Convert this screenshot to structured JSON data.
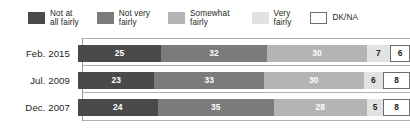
{
  "legend": {
    "items": [
      {
        "label": "Not at\nall fairly",
        "color": "#4a4a4a",
        "outlined": false
      },
      {
        "label": "Not very\nfairly",
        "color": "#7b7b7b",
        "outlined": false
      },
      {
        "label": "Somewhat\nfairly",
        "color": "#b4b4b4",
        "outlined": false
      },
      {
        "label": "Very\nfairly",
        "color": "#e2e2e2",
        "outlined": false
      },
      {
        "label": "DK/NA",
        "color": "#ffffff",
        "outlined": true
      }
    ]
  },
  "chart_data": {
    "type": "bar",
    "orientation": "horizontal",
    "stacked": true,
    "stack_total": 100,
    "title": "",
    "xlabel": "",
    "ylabel": "",
    "xlim": [
      0,
      100
    ],
    "grid": true,
    "legend_position": "top",
    "categories": [
      "Feb. 2015",
      "Jul. 2009",
      "Dec. 2007"
    ],
    "series": [
      {
        "name": "Not at all fairly",
        "color": "#4a4a4a",
        "values": [
          25,
          23,
          24
        ]
      },
      {
        "name": "Not very fairly",
        "color": "#7b7b7b",
        "values": [
          32,
          33,
          35
        ]
      },
      {
        "name": "Somewhat fairly",
        "color": "#b4b4b4",
        "values": [
          30,
          30,
          28
        ]
      },
      {
        "name": "Very fairly",
        "color": "#e2e2e2",
        "values": [
          7,
          6,
          5
        ]
      },
      {
        "name": "DK/NA",
        "color": "#ffffff",
        "values": [
          6,
          8,
          8
        ]
      }
    ],
    "rows": [
      {
        "label": "Feb. 2015",
        "segments": [
          {
            "value": 25,
            "text": "25"
          },
          {
            "value": 32,
            "text": "32"
          },
          {
            "value": 30,
            "text": "30"
          },
          {
            "value": 7,
            "text": "7"
          },
          {
            "value": 6,
            "text": "6"
          }
        ]
      },
      {
        "label": "Jul. 2009",
        "segments": [
          {
            "value": 23,
            "text": "23"
          },
          {
            "value": 33,
            "text": "33"
          },
          {
            "value": 30,
            "text": "30"
          },
          {
            "value": 6,
            "text": "6"
          },
          {
            "value": 8,
            "text": "8"
          }
        ]
      },
      {
        "label": "Dec. 2007",
        "segments": [
          {
            "value": 24,
            "text": "24"
          },
          {
            "value": 35,
            "text": "35"
          },
          {
            "value": 28,
            "text": "28"
          },
          {
            "value": 5,
            "text": "5"
          },
          {
            "value": 8,
            "text": "8"
          }
        ]
      }
    ]
  }
}
